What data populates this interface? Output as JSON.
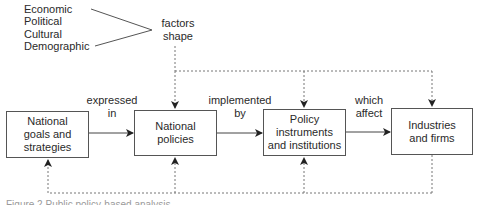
{
  "factors": {
    "items": [
      "Economic",
      "Political",
      "Cultural",
      "Demographic"
    ],
    "label": "factors\nshape"
  },
  "boxes": [
    {
      "id": "goals",
      "label": "National\ngoals and\nstrategies"
    },
    {
      "id": "policies",
      "label": "National\npolicies"
    },
    {
      "id": "instruments",
      "label": "Policy\ninstruments\nand institutions"
    },
    {
      "id": "industries",
      "label": "Industries\nand firms"
    }
  ],
  "edges": [
    {
      "from": "goals",
      "to": "policies",
      "label": "expressed\nin"
    },
    {
      "from": "policies",
      "to": "instruments",
      "label": "implemented\nby"
    },
    {
      "from": "instruments",
      "to": "industries",
      "label": "which\naffect"
    }
  ],
  "feedback": {
    "top_targets": [
      "policies",
      "instruments",
      "industries"
    ],
    "bottom_source": "industries",
    "bottom_targets": [
      "goals",
      "policies",
      "instruments"
    ]
  },
  "caption": "Figure 2 Public policy-based analysis"
}
